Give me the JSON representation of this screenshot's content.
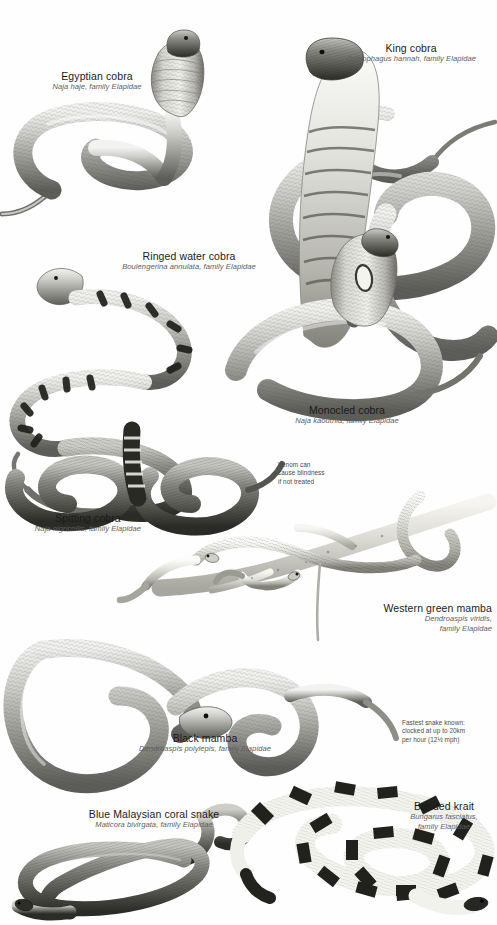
{
  "page": {
    "background_color": "#ffffff",
    "title_text_color": "#1a1a1a",
    "sci_text_color": "#5d5d5d",
    "note_text_color": "#4a4a4a",
    "width": 497,
    "height": 925
  },
  "species": [
    {
      "id": "egyptian-cobra",
      "common": "Egyptian cobra",
      "sci": "Naja haje, family Elapidae",
      "align": "center"
    },
    {
      "id": "king-cobra",
      "common": "King cobra",
      "sci": "Ophiophagus hannah, family Elapidae",
      "align": "center"
    },
    {
      "id": "ringed-water-cobra",
      "common": "Ringed water cobra",
      "sci": "Boulengerina annulata, family Elapidae",
      "align": "center"
    },
    {
      "id": "monocled-cobra",
      "common": "Monocled cobra",
      "sci": "Naja kaouthia, family Elapidae",
      "align": "center"
    },
    {
      "id": "spitting-cobra",
      "common": "Spitting cobra",
      "sci": "Naja nigricollis, family Elapidae",
      "align": "center"
    },
    {
      "id": "western-green-mamba",
      "common": "Western green mamba",
      "sci_line1": "Dendroaspis viridis,",
      "sci_line2": "family Elapidae",
      "align": "right"
    },
    {
      "id": "black-mamba",
      "common": "Black mamba",
      "sci": "Dendroaspis polylepis, family Elapidae",
      "align": "center"
    },
    {
      "id": "blue-malaysian-coral-snake",
      "common": "Blue Malaysian coral snake",
      "sci": "Maticora bivirgata, family Elapidae",
      "align": "center"
    },
    {
      "id": "banded-krait",
      "common": "Banded krait",
      "sci_line1": "Bungarus fasciatus,",
      "sci_line2": "family Elapidae",
      "align": "center"
    }
  ],
  "notes": [
    {
      "id": "venom-blindness-note",
      "line1": "Venom can",
      "line2": "cause blindness",
      "line3": "if not treated"
    },
    {
      "id": "fastest-snake-note",
      "line1": "Fastest snake known:",
      "line2": "clocked at up to 20km",
      "line3": "per hour (12½ mph)"
    }
  ],
  "illustrations": [
    {
      "id": "egyptian-cobra-illustration",
      "subject": "Egyptian cobra rearing with hood spread"
    },
    {
      "id": "king-cobra-illustration",
      "subject": "King cobra rearing with banded hood"
    },
    {
      "id": "ringed-water-cobra-illustration",
      "subject": "Ringed water cobra coiled with dark bands"
    },
    {
      "id": "monocled-cobra-illustration",
      "subject": "Monocled cobra coiled with spectacle hood mark"
    },
    {
      "id": "spitting-cobra-illustration",
      "subject": "Spitting cobra coiled dark body"
    },
    {
      "id": "western-green-mamba-illustration",
      "subject": "Western green mamba on a branch"
    },
    {
      "id": "black-mamba-illustration",
      "subject": "Black mamba in wide loops"
    },
    {
      "id": "blue-malaysian-coral-snake-illustration",
      "subject": "Blue Malaysian coral snake in figure-eight coil"
    },
    {
      "id": "banded-krait-illustration",
      "subject": "Banded krait with black and pale bands"
    }
  ]
}
